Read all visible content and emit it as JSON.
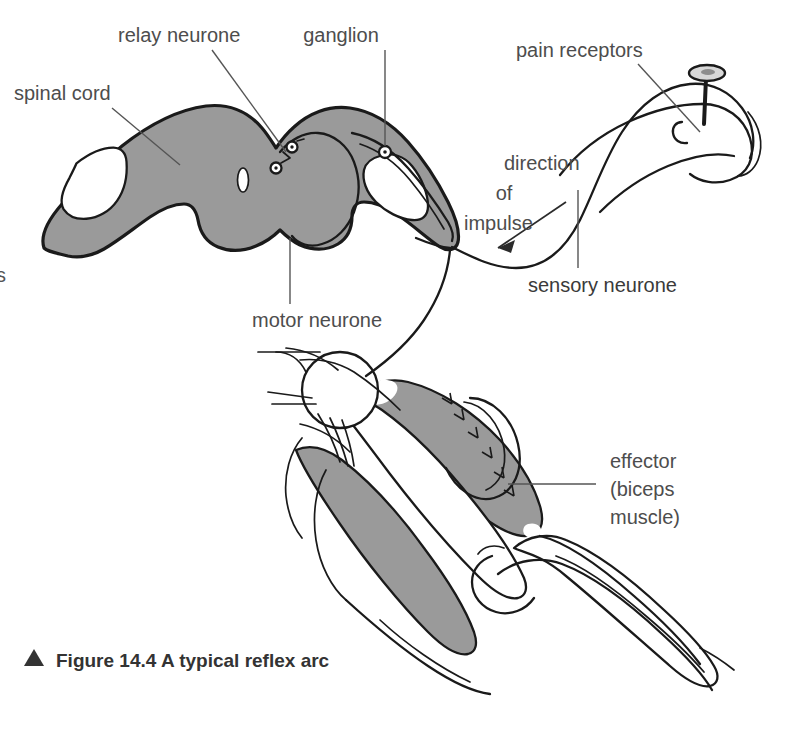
{
  "figure": {
    "caption_marker": "▲",
    "caption": "Figure 14.4 A typical reflex arc",
    "bleed_text": "s"
  },
  "colors": {
    "tissue_gray": "#9a9a9a",
    "ink": "#1a1a1a",
    "label_gray": "#4d4d4d",
    "caption_gray": "#333333",
    "background": "#ffffff"
  },
  "labels": {
    "spinal_cord": "spinal cord",
    "relay_neurone": "relay neurone",
    "ganglion": "ganglion",
    "pain_receptors": "pain receptors",
    "sensory_neurone": "sensory neurone",
    "motor_neurone": "motor neurone",
    "direction_line1": "direction",
    "direction_line2": "of",
    "direction_line3": "impulse",
    "effector_line1": "effector",
    "effector_line2": "(biceps",
    "effector_line3": "muscle)"
  },
  "diagram_parts": {
    "spinal_cord_section": "butterfly-shaped gray matter cross-section with white matter voids and central canal",
    "ganglion_node": "dorsal root ganglion circle",
    "synapse_nodes": "two small synapse circles in dorsal horn",
    "pin": "pin stuck into fingertip",
    "arm": "flexed arm showing biceps and triceps",
    "biceps_muscle": "shaded biceps muscle",
    "triceps_muscle": "shaded triceps muscle",
    "shoulder_joint": "humeral head and scapula",
    "elbow_joint": "elbow with radius and ulna"
  }
}
